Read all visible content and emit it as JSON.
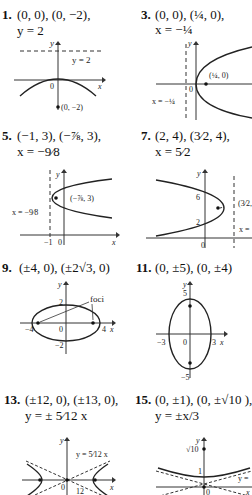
{
  "problems": [
    {
      "number": "1.",
      "line1": "(0, 0), (0, −2),",
      "line2": "y = 2",
      "graph": {
        "y_label": "y",
        "x_label": "x",
        "origin": "0",
        "directrix": "y = 2",
        "point": "(0, −2)"
      }
    },
    {
      "number": "3.",
      "line1": "(0, 0), (¼, 0),",
      "line2": "x = −¼",
      "graph": {
        "y_label": "y",
        "x_label": "x",
        "origin": "0",
        "directrix": "x = −¼",
        "point": "(¼, 0)"
      }
    },
    {
      "number": "5.",
      "line1": "(−1, 3), (−⅞, 3),",
      "line2": "x = −9⁄8",
      "graph": {
        "y_label": "y",
        "x_label": "x",
        "origin": "0",
        "tick": "−1",
        "directrix": "x = −9⁄8",
        "point": "(−⅞, 3)"
      }
    },
    {
      "number": "7.",
      "line1": "(2, 4), (3⁄2, 4),",
      "line2": "x = 5⁄2",
      "graph": {
        "y_label": "y",
        "x_label": "x",
        "origin": "0",
        "tick_6": "6",
        "tick_2": "2",
        "directrix": "x =",
        "point": "(3⁄2,"
      }
    },
    {
      "number": "9.",
      "line1": "(±4, 0), (±2√3, 0)",
      "graph": {
        "y_label": "y",
        "x_label": "x",
        "origin": "0",
        "tick_2": "2",
        "tick_neg2": "−2",
        "tick_neg4": "−4",
        "tick_4": "4",
        "annotation": "foci"
      }
    },
    {
      "number": "11.",
      "line1": "(0, ±5), (0, ±4)",
      "graph": {
        "y_label": "y",
        "x_label": "x",
        "origin": "0",
        "tick_5": "5",
        "tick_neg5": "−5",
        "tick_neg3": "−3",
        "tick_3": "3"
      }
    },
    {
      "number": "13.",
      "line1": "(±12, 0), (±13, 0),",
      "line2": "y = ± 5⁄12 x",
      "graph": {
        "y_label": "y",
        "x_label": "x",
        "origin": "0",
        "asymptote": "y = 5⁄12 x",
        "tick_12": "12"
      }
    },
    {
      "number": "15.",
      "line1": "(0, ±1), (0, ±√10 ),",
      "line2": "y = ±x/3",
      "graph": {
        "y_label": "y",
        "x_label": "x",
        "origin": "0",
        "tick_sqrt10": "√10",
        "tick_1": "1",
        "asymptote": "y ="
      }
    }
  ]
}
